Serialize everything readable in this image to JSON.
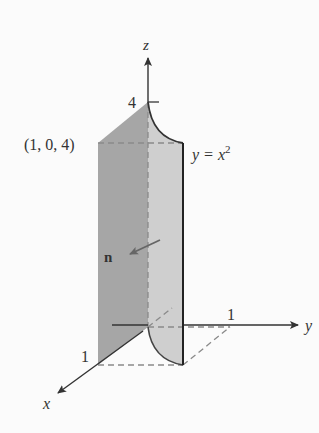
{
  "diagram": {
    "axes": {
      "x": "x",
      "y": "y",
      "z": "z"
    },
    "ticks": {
      "z_top": "4",
      "x_one": "1",
      "y_one": "1"
    },
    "point_label": "(1, 0, 4)",
    "curve_label_base": "y = x",
    "curve_label_exp": "2",
    "normal_label": "n",
    "colors": {
      "dark_face": "#a6a6a6",
      "light_face": "#cfcfcf",
      "edge": "#333333",
      "dashed": "#8a8a8a",
      "background": "#fbfbfb"
    }
  }
}
